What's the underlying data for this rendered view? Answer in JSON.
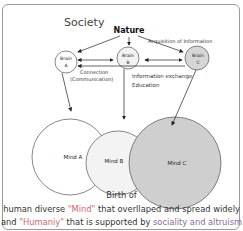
{
  "title": "Society",
  "nature_label": "Nature",
  "acquisition_label": "Acquisition of Information",
  "brains": [
    {
      "line1": "Brain",
      "line2": "A"
    },
    {
      "line1": "Brain",
      "line2": "B"
    },
    {
      "line1": "Brain",
      "line2": "C"
    }
  ],
  "connection_label": "Connection",
  "communication_label": "(Communication)",
  "info_exchange_label": "Information exchange",
  "education_label": "Education",
  "minds": [
    "Mind A",
    "Mind B",
    "Mind C"
  ],
  "caption": {
    "line1": "Birth of",
    "line2_a": "human diverse ",
    "line2_mind": "\"Mind\"",
    "line2_b": " that overllaped and spread widely",
    "line3_a": "and ",
    "line3_humaniy": "\"Humaniy\"",
    "line3_b": " that is supported by ",
    "line3_social": "sociality and altruism"
  },
  "colors": {
    "highlight_red": "#d0676f",
    "highlight_purple": "#8a6aa0",
    "mind_c_fill": "#cfcfcf",
    "brain_c_fill": "#d6d6d6"
  }
}
